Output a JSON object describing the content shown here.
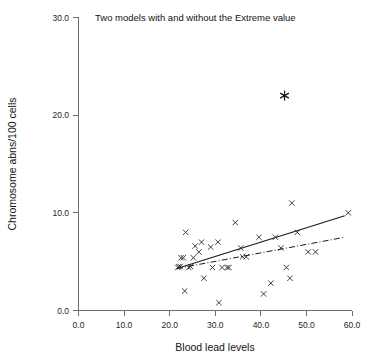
{
  "chart_data": {
    "type": "scatter",
    "title": "Two models with and without the Extreme value",
    "xlabel": "Blood lead levels",
    "ylabel": "Chromosome abns/100 cells",
    "xlim": [
      0.0,
      60.0
    ],
    "ylim": [
      0.0,
      30.0
    ],
    "xticks": [
      "0.0",
      "10.0",
      "20.0",
      "30.0",
      "40.0",
      "50.0",
      "60.0"
    ],
    "xtick_values": [
      0.0,
      10.0,
      20.0,
      30.0,
      40.0,
      50.0,
      60.0
    ],
    "yticks": [
      "0.0",
      "10.0",
      "20.0",
      "30.0"
    ],
    "ytick_values": [
      0.0,
      10.0,
      20.0,
      30.0
    ],
    "grid": false,
    "legend": null,
    "series": [
      {
        "name": "Observations",
        "marker": "x",
        "points": [
          [
            21.8,
            4.4
          ],
          [
            22.0,
            4.5
          ],
          [
            22.3,
            4.5
          ],
          [
            22.5,
            5.4
          ],
          [
            23.0,
            5.4
          ],
          [
            23.3,
            2.0
          ],
          [
            23.5,
            8.0
          ],
          [
            24.2,
            4.4
          ],
          [
            24.6,
            4.5
          ],
          [
            25.2,
            5.4
          ],
          [
            25.6,
            6.6
          ],
          [
            26.4,
            6.0
          ],
          [
            27.0,
            7.0
          ],
          [
            27.5,
            3.3
          ],
          [
            29.0,
            6.5
          ],
          [
            29.4,
            4.4
          ],
          [
            30.6,
            7.0
          ],
          [
            30.8,
            0.8
          ],
          [
            31.5,
            4.4
          ],
          [
            32.6,
            4.4
          ],
          [
            33.0,
            4.4
          ],
          [
            34.4,
            9.0
          ],
          [
            35.6,
            6.4
          ],
          [
            36.0,
            5.5
          ],
          [
            36.8,
            5.5
          ],
          [
            39.6,
            7.5
          ],
          [
            40.6,
            1.7
          ],
          [
            42.2,
            2.8
          ],
          [
            43.2,
            7.5
          ],
          [
            44.4,
            6.4
          ],
          [
            45.6,
            4.4
          ],
          [
            46.4,
            3.3
          ],
          [
            46.8,
            11.0
          ],
          [
            48.0,
            8.0
          ],
          [
            50.4,
            6.0
          ],
          [
            52.0,
            6.0
          ],
          [
            59.2,
            10.0
          ]
        ]
      },
      {
        "name": "Extreme value",
        "marker": "star",
        "points": [
          [
            45.2,
            22.0
          ]
        ]
      }
    ],
    "lines": [
      {
        "name": "Model with the Extreme value",
        "style": "solid",
        "x": [
          21.6,
          58.4
        ],
        "y": [
          4.3,
          9.7
        ]
      },
      {
        "name": "Model without the Extreme value",
        "style": "dash-dot",
        "x": [
          21.6,
          58.4
        ],
        "y": [
          4.3,
          7.5
        ]
      }
    ]
  }
}
